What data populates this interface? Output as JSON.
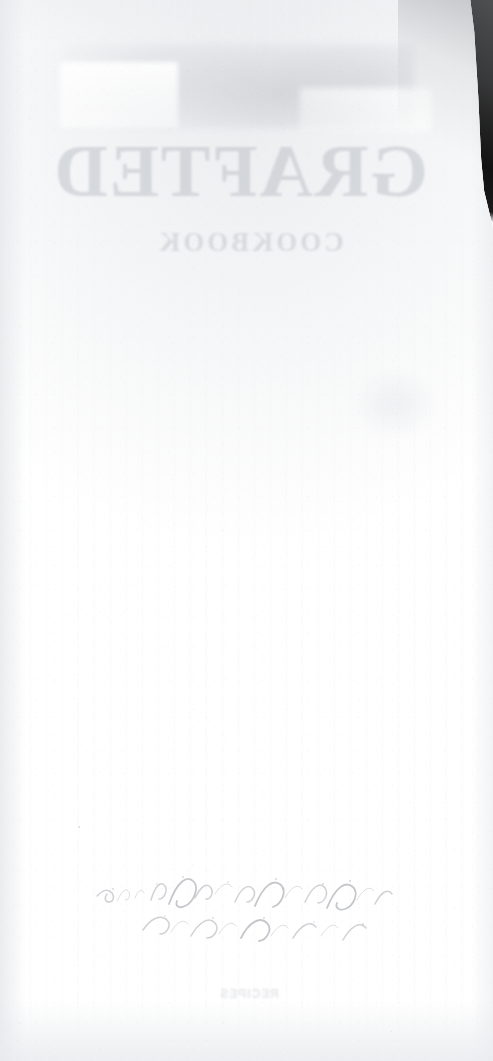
{
  "scan": {
    "kind": "scanned-page",
    "surface": "blank-verso-of-printed-page",
    "width_px": 493,
    "height_px": 1061,
    "legible_text_present": false,
    "notes": "Near-blank white page photographed against a dark backdrop; all lettering visible is mirrored ink show-through from the opposite side and is not reliably legible."
  },
  "backdrop": {
    "label": "dark backdrop beyond page edge",
    "color": "#0a0a0a",
    "visible_region": "top-right corner only"
  },
  "page": {
    "label": "paper page",
    "paper_color": "#ffffff",
    "edge_tint": "#e7e9ec",
    "shadow_color": "#96989c"
  },
  "artifacts": {
    "wash_band": {
      "label": "diffuse grey ink wash",
      "color": "#c4c7cc"
    },
    "wash_patch": {
      "label": "pale rectangular ghost patch"
    },
    "mid_blot": {
      "label": "faint mid-page blot",
      "color": "#e4e6ea"
    },
    "title_bleed": {
      "label": "mirrored show-through title",
      "text": "GRAFTED",
      "legible": false,
      "color": "#abb0b8"
    },
    "subtitle_bleed": {
      "label": "mirrored show-through subtitle",
      "text": "COOKBOOK",
      "legible": false,
      "color": "#b2b6be"
    },
    "caption_bleed": {
      "label": "mirrored show-through caption line",
      "text": "RECIPES",
      "legible": false,
      "color": "#c6c9cf"
    },
    "handwriting": {
      "label": "faint handwritten inscription",
      "legible": false,
      "ink_color": "#8f949c"
    }
  }
}
